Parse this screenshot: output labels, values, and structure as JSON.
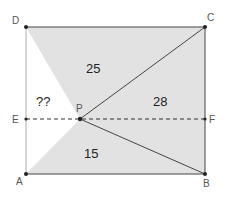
{
  "diagram": {
    "title": "",
    "points": {
      "A": {
        "label": "A",
        "x": 26,
        "y": 174
      },
      "B": {
        "label": "B",
        "x": 205,
        "y": 174
      },
      "C": {
        "label": "C",
        "x": 205,
        "y": 27
      },
      "D": {
        "label": "D",
        "x": 26,
        "y": 27
      },
      "E": {
        "label": "E",
        "x": 26,
        "y": 119
      },
      "F": {
        "label": "F",
        "x": 205,
        "y": 119
      },
      "P": {
        "label": "P",
        "x": 80,
        "y": 119
      }
    },
    "regions": [
      {
        "name": "triangle-DPC",
        "value": "25"
      },
      {
        "name": "triangle-CPB",
        "value": "28"
      },
      {
        "name": "triangle-APB",
        "value": "15"
      },
      {
        "name": "triangle-APD",
        "value": "??"
      }
    ],
    "colors": {
      "shade": "#e2e2e2",
      "line": "#444444",
      "point": "#222222"
    }
  }
}
